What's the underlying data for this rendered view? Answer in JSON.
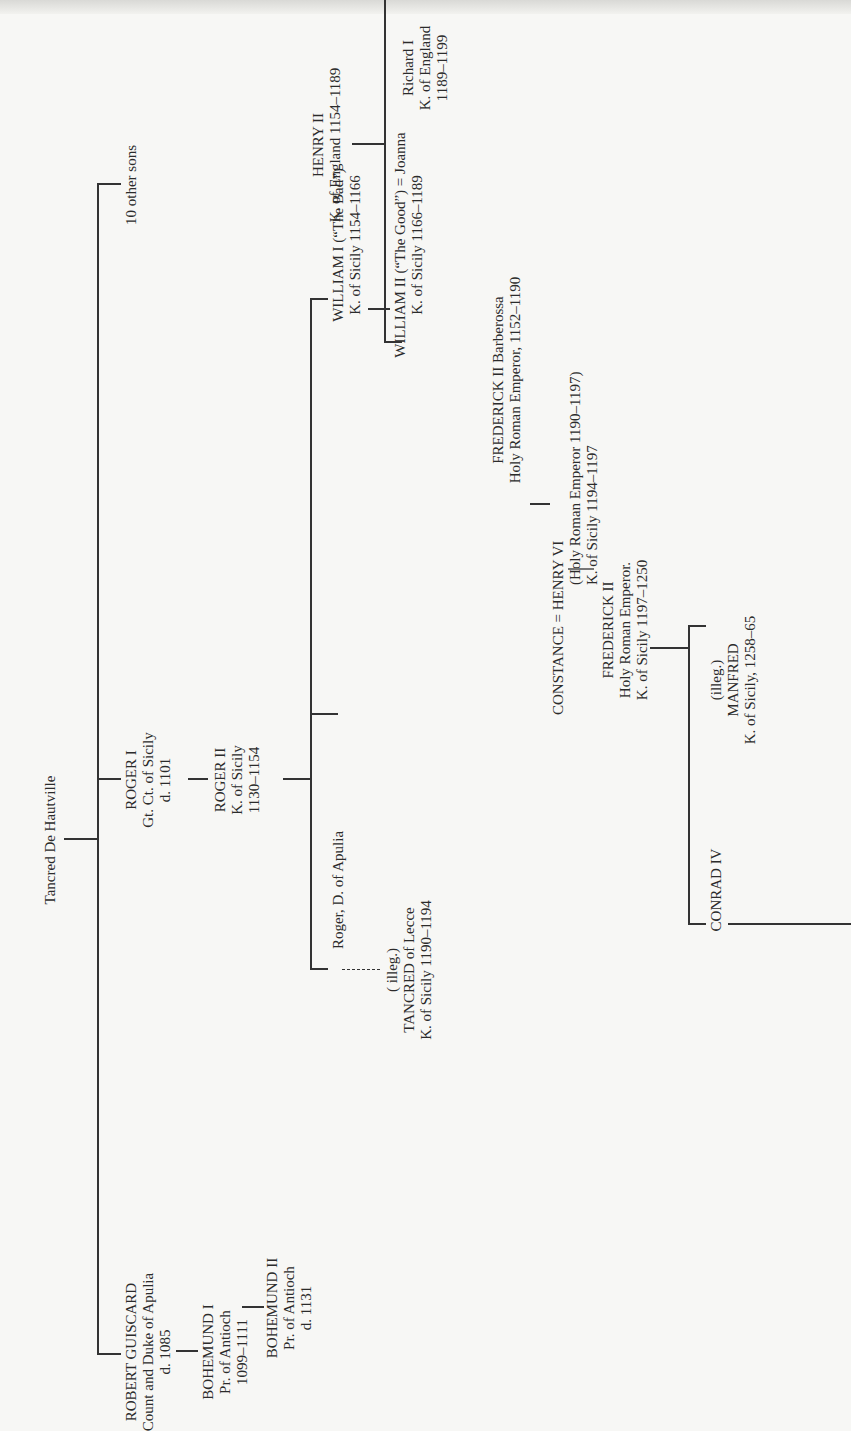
{
  "diagram": {
    "type": "family-tree",
    "orientation": "rotated-90-ccw",
    "root": {
      "name": "Tancred De Hautville"
    },
    "generation1": [
      {
        "id": "robert",
        "name": "ROBERT GUISCARD",
        "title": "Count and Duke of Apulia",
        "dates": "d. 1085"
      },
      {
        "id": "roger1",
        "name": "ROGER I",
        "title": "Gt. Ct. of Sicily",
        "dates": "d. 1101"
      },
      {
        "id": "others",
        "name": "10 other sons"
      }
    ],
    "bohemund1": {
      "name": "BOHEMUND I",
      "title": "Pr. of Antioch",
      "dates": "1099–1111"
    },
    "bohemund2": {
      "name": "BOHEMUND II",
      "title": "Pr. of Antioch",
      "dates": "d. 1131"
    },
    "roger2": {
      "name": "ROGER II",
      "title": "K. of Sicily",
      "dates": "1130–1154"
    },
    "roger_apulia": {
      "name": "Roger, D. of Apulia"
    },
    "tancred_lecce": {
      "note": "( illeg.)",
      "name": "TANCRED of Lecce",
      "title": "K. of Sicily 1190–1194"
    },
    "william1": {
      "name": "WILLIAM I (“The Bad”)",
      "title": "K. of Sicily 1154–1166"
    },
    "william2": {
      "name": "WILLIAM II (“The Good”) = Joanna",
      "title": "K. of Sicily 1166–1189"
    },
    "henry2": {
      "name": "HENRY II",
      "title": "K. of England 1154–1189"
    },
    "richard1": {
      "name": "Richard I",
      "title": "K. of England",
      "dates": "1189–1199"
    },
    "barbarossa": {
      "name": "FREDERICK II Barberossa",
      "title": "Holy Roman Emperor, 1152–1190"
    },
    "constance": {
      "name": "CONSTANCE = HENRY VI",
      "title": "(Holy Roman Emperor 1190–1197)",
      "dates": "K. of Sicily 1194–1197"
    },
    "frederick2": {
      "name": "FREDERICK II",
      "title": "Holy Roman Emperor.",
      "dates": "K. of Sicily 1197–1250"
    },
    "manfred": {
      "note": "(illeg.)",
      "name": "MANFRED",
      "title": "K. of Sicily, 1258–65"
    },
    "conrad4": {
      "name": "CONRAD IV"
    }
  }
}
